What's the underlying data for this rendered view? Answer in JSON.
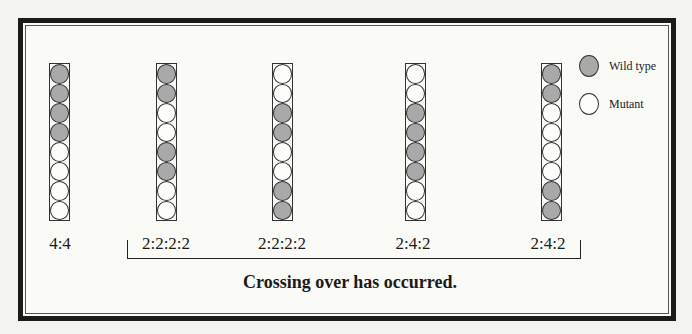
{
  "legend": {
    "wild_label": "Wild type",
    "mutant_label": "Mutant",
    "wild_color": "#a9a9a9",
    "mutant_color": "#fdfdfb"
  },
  "asci": [
    {
      "ratio": "4:4",
      "spores": [
        "W",
        "W",
        "W",
        "W",
        "M",
        "M",
        "M",
        "M"
      ]
    },
    {
      "ratio": "2:2:2:2",
      "spores": [
        "W",
        "W",
        "M",
        "M",
        "W",
        "W",
        "M",
        "M"
      ]
    },
    {
      "ratio": "2:2:2:2",
      "spores": [
        "M",
        "M",
        "W",
        "W",
        "M",
        "M",
        "W",
        "W"
      ]
    },
    {
      "ratio": "2:4:2",
      "spores": [
        "M",
        "M",
        "W",
        "W",
        "W",
        "W",
        "M",
        "M"
      ]
    },
    {
      "ratio": "2:4:2",
      "spores": [
        "W",
        "W",
        "M",
        "M",
        "M",
        "M",
        "W",
        "W"
      ]
    }
  ],
  "caption": "Crossing over has occurred."
}
